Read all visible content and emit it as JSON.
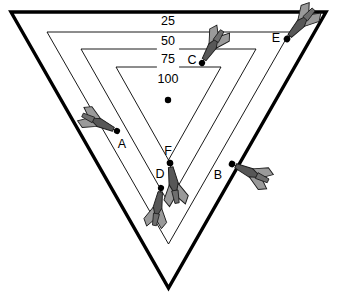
{
  "figure": {
    "kind": "dartboard-triangle-target",
    "background_color": "#ffffff",
    "ink_color": "#000000",
    "dart_body_color": "#575757",
    "dart_fin_color": "#9a9a9a",
    "dart_dark_color": "#1c1c1c"
  },
  "board": {
    "shape": "inverted-triangle",
    "outer": {
      "left_x": 11,
      "right_x": 326,
      "top_y": 12,
      "apex_y": 288,
      "stroke_width": 3.4
    },
    "rings": [
      {
        "label": "25",
        "value": 25,
        "left_x": 47,
        "right_x": 290,
        "top_y": 32,
        "apex_y": 244,
        "stroke_width": 0.9,
        "label_x": 168,
        "label_y": 22
      },
      {
        "label": "50",
        "value": 50,
        "left_x": 81,
        "right_x": 256,
        "top_y": 49,
        "apex_y": 203,
        "stroke_width": 0.9,
        "label_x": 168,
        "label_y": 42
      },
      {
        "label": "75",
        "value": 75,
        "left_x": 116,
        "right_x": 221,
        "top_y": 67,
        "apex_y": 160,
        "stroke_width": 0.9,
        "label_x": 168,
        "label_y": 60
      },
      {
        "label": "100",
        "value": 100,
        "left_x": 0,
        "right_x": 0,
        "top_y": 0,
        "apex_y": 0,
        "stroke_width": 0,
        "label_x": 168,
        "label_y": 80
      }
    ],
    "bullseye": {
      "x": 168,
      "y": 100,
      "radius": 3.2
    }
  },
  "darts": [
    {
      "id": "A",
      "label": "A",
      "label_x": 122,
      "label_y": 145,
      "tip_x": 117,
      "tip_y": 131,
      "angle_deg": 205,
      "length": 42,
      "scored_ring": "outside"
    },
    {
      "id": "B",
      "label": "B",
      "label_x": 218,
      "label_y": 176,
      "tip_x": 232,
      "tip_y": 164,
      "angle_deg": 25,
      "length": 44,
      "scored_ring": "outside"
    },
    {
      "id": "C",
      "label": "C",
      "label_x": 192,
      "label_y": 61,
      "tip_x": 202,
      "tip_y": 63,
      "angle_deg": 302,
      "length": 42,
      "scored_ring": "50"
    },
    {
      "id": "D",
      "label": "D",
      "label_x": 160,
      "label_y": 175,
      "tip_x": 161,
      "tip_y": 188,
      "angle_deg": 100,
      "length": 42,
      "scored_ring": "75"
    },
    {
      "id": "E",
      "label": "E",
      "label_x": 276,
      "label_y": 39,
      "tip_x": 287,
      "tip_y": 39,
      "angle_deg": 312,
      "length": 44,
      "scored_ring": "25"
    },
    {
      "id": "F",
      "label": "F",
      "label_x": 168,
      "label_y": 152,
      "tip_x": 170,
      "tip_y": 163,
      "angle_deg": 80,
      "length": 45,
      "scored_ring": "75"
    }
  ]
}
